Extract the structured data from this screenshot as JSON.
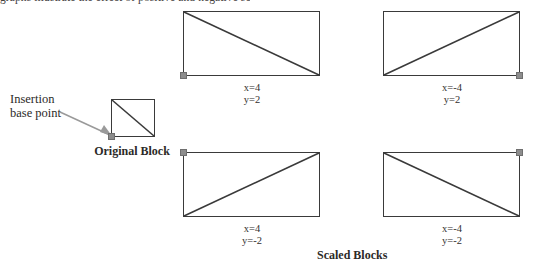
{
  "page": {
    "clipped_top_text": "graphs illustrate the effect of positive and negative scale factors"
  },
  "callout": {
    "line1": "Insertion",
    "line2": "base point",
    "arrow_icon": "arrow-pointer-icon"
  },
  "original": {
    "caption": "Original Block",
    "base_point_corner": "bottom-left",
    "diagonal": "top-left-to-bottom-right"
  },
  "scaled": {
    "caption": "Scaled Blocks",
    "blocks": [
      {
        "name": "scaled-block-top-left",
        "x_label": "x=4",
        "y_label": "y=2",
        "base_point_corner": "bottom-left",
        "diagonal": "top-left-to-bottom-right"
      },
      {
        "name": "scaled-block-top-right",
        "x_label": "x=-4",
        "y_label": "y=2",
        "base_point_corner": "bottom-right",
        "diagonal": "bottom-left-to-top-right"
      },
      {
        "name": "scaled-block-bottom-left",
        "x_label": "x=4",
        "y_label": "y=-2",
        "base_point_corner": "top-left",
        "diagonal": "bottom-left-to-top-right"
      },
      {
        "name": "scaled-block-bottom-right",
        "x_label": "x=-4",
        "y_label": "y=-2",
        "base_point_corner": "top-right",
        "diagonal": "top-left-to-bottom-right"
      }
    ]
  },
  "colors": {
    "stroke": "#3a3a3a",
    "base_point": "#8d8d8d",
    "arrow": "#9a9a9a",
    "text": "#2c2a28",
    "background": "#ffffff"
  }
}
